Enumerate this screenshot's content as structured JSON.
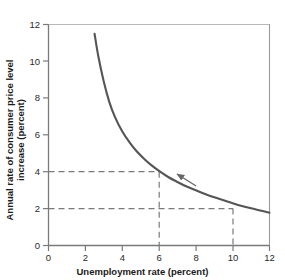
{
  "chart_data": {
    "type": "line",
    "title": "",
    "xlabel": "Unemployment rate (percent)",
    "ylabel_line1": "Annual rate of consumer price level",
    "ylabel_line2": "increase (percent)",
    "xlim": [
      0,
      12
    ],
    "ylim": [
      0,
      12
    ],
    "xticks": [
      0,
      2,
      4,
      6,
      8,
      10,
      12
    ],
    "xtick_labels": [
      "0",
      "2",
      "4",
      "6",
      "8",
      "10",
      "12"
    ],
    "yticks": [
      0,
      2,
      4,
      6,
      8,
      10,
      12
    ],
    "ytick_labels": [
      "0",
      "2",
      "4",
      "6",
      "8",
      "10",
      "12"
    ],
    "grid": false,
    "legend": "none",
    "series": [
      {
        "name": "Phillips curve",
        "color": "#555555",
        "x": [
          2.5,
          2.7,
          3.0,
          3.3,
          3.6,
          4.0,
          4.4,
          4.8,
          5.2,
          5.6,
          6.0,
          6.5,
          7.0,
          7.5,
          8.0,
          8.5,
          9.0,
          9.5,
          10.0,
          10.5,
          11.0,
          11.5,
          12.0
        ],
        "y": [
          11.5,
          10.3,
          8.9,
          7.8,
          7.0,
          6.2,
          5.6,
          5.1,
          4.7,
          4.35,
          4.05,
          3.72,
          3.45,
          3.2,
          3.0,
          2.8,
          2.62,
          2.46,
          2.3,
          2.15,
          2.02,
          1.9,
          1.78
        ]
      }
    ],
    "reference_lines": [
      {
        "name": "inflation-4-percent",
        "type": "horizontal",
        "value": 4,
        "from_x": 0,
        "to_x": 6,
        "style": "dashed"
      },
      {
        "name": "unemployment-6-percent",
        "type": "vertical",
        "value": 6,
        "from_y": 0,
        "to_y": 4,
        "style": "dashed"
      },
      {
        "name": "inflation-2-percent",
        "type": "horizontal",
        "value": 2,
        "from_x": 0,
        "to_x": 10,
        "style": "dashed"
      },
      {
        "name": "unemployment-10-percent",
        "type": "vertical",
        "value": 10,
        "from_y": 0,
        "to_y": 2,
        "style": "dashed"
      }
    ],
    "annotations": [
      {
        "name": "movement-arrow",
        "kind": "arrow",
        "direction": "up-left",
        "from": {
          "x": 8.0,
          "y": 2.9
        },
        "to": {
          "x": 6.55,
          "y": 3.85
        },
        "label": ""
      }
    ],
    "colors": {
      "curve": "#555555",
      "axis": "#7a7a7a",
      "dashed": "#7a7a7a",
      "text": "#1a1a1a",
      "background": "#ffffff"
    }
  }
}
